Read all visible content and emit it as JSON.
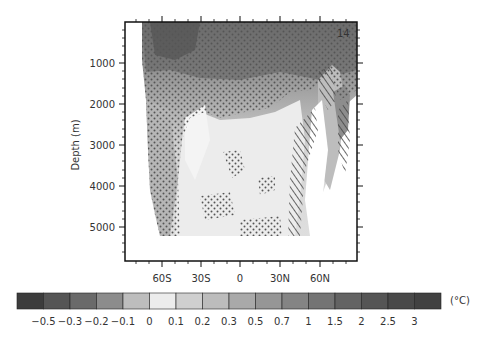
{
  "chart_data": {
    "type": "heatmap",
    "title": "",
    "panel_label": "14",
    "xlabel": "",
    "ylabel": "Depth (m)",
    "x_tick_labels": [
      "60S",
      "30S",
      "0",
      "30N",
      "60N"
    ],
    "x_tick_values": [
      -60,
      -30,
      0,
      30,
      60
    ],
    "y_tick_labels": [
      "1000",
      "2000",
      "3000",
      "4000",
      "5000"
    ],
    "y_tick_values": [
      1000,
      2000,
      3000,
      4000,
      5000
    ],
    "xlim": [
      -88,
      88
    ],
    "ylim": [
      0,
      5800
    ],
    "y_inverted": true,
    "grid": false,
    "colorbar": {
      "orientation": "horizontal",
      "position": "bottom",
      "unit": "(°C)",
      "boundaries": [
        "-0.5",
        "-0.3",
        "-0.2",
        "-0.1",
        "0",
        "0.1",
        "0.2",
        "0.3",
        "0.5",
        "0.7",
        "1",
        "1.5",
        "2",
        "2.5",
        "3"
      ],
      "colors": [
        "#3c3c3c",
        "#555555",
        "#6a6a6a",
        "#8c8c8c",
        "#bdbdbd",
        "#ececec",
        "#cfcfcf",
        "#bcbcbc",
        "#a9a9a9",
        "#969696",
        "#848484",
        "#747474",
        "#636363",
        "#555555",
        "#494949",
        "#414141"
      ]
    },
    "regions": [
      {
        "name": "upper-ocean",
        "lat_range": [
          -80,
          88
        ],
        "depth_range": [
          0,
          1000
        ],
        "value_approx": "1 to 3"
      },
      {
        "name": "intermediate",
        "lat_range": [
          -80,
          40
        ],
        "depth_range": [
          1000,
          2000
        ],
        "value_approx": "0.3 to 0.7"
      },
      {
        "name": "deep-ocean",
        "lat_range": [
          -60,
          50
        ],
        "depth_range": [
          2000,
          5200
        ],
        "value_approx": "0 to 0.2"
      },
      {
        "name": "southern-deep",
        "lat_range": [
          -80,
          -50
        ],
        "depth_range": [
          1500,
          5000
        ],
        "value_approx": "0.2 to 0.5"
      },
      {
        "name": "north-atlantic-hatched",
        "lat_range": [
          40,
          75
        ],
        "depth_range": [
          1000,
          5200
        ],
        "value_approx": "0.5 to 1"
      }
    ]
  }
}
